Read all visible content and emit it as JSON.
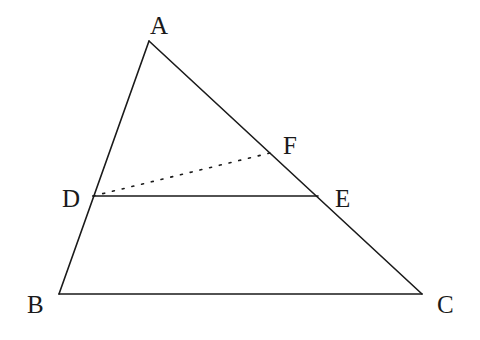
{
  "diagram": {
    "type": "geometry",
    "points": {
      "A": {
        "label": "A",
        "x": 149,
        "y": 41,
        "label_x": 150,
        "label_y": 34
      },
      "B": {
        "label": "B",
        "x": 59,
        "y": 294,
        "label_x": 27,
        "label_y": 313
      },
      "C": {
        "label": "C",
        "x": 422,
        "y": 294,
        "label_x": 437,
        "label_y": 313
      },
      "D": {
        "label": "D",
        "x": 93,
        "y": 196,
        "label_x": 62,
        "label_y": 207
      },
      "E": {
        "label": "E",
        "x": 318,
        "y": 196,
        "label_x": 335,
        "label_y": 207
      },
      "F": {
        "label": "F",
        "x": 270,
        "y": 153,
        "label_x": 283,
        "label_y": 154
      }
    },
    "segments": [
      {
        "from": "A",
        "to": "B",
        "style": "solid"
      },
      {
        "from": "A",
        "to": "C",
        "style": "solid"
      },
      {
        "from": "B",
        "to": "C",
        "style": "solid"
      },
      {
        "from": "D",
        "to": "E",
        "style": "solid"
      },
      {
        "from": "D",
        "to": "F",
        "style": "dotted"
      }
    ],
    "colors": {
      "stroke": "#1a1a1a",
      "background": "#ffffff"
    }
  }
}
